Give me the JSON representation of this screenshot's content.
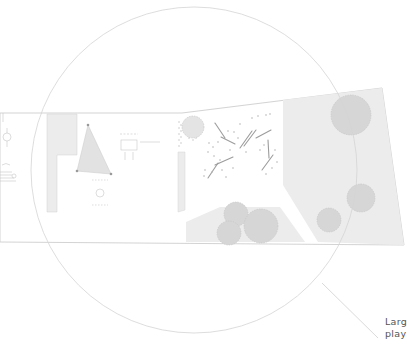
{
  "diagram": {
    "type": "site-plan",
    "colors": {
      "background": "#ffffff",
      "site_outline": "#c8c8c8",
      "paved_fill": "#ececec",
      "tree_fill": "#d6d6d6",
      "tree_edge": "#c4c4c4",
      "focus_circle": "#d4d4d4",
      "leader_line": "#d0d0d0",
      "label_text": "#555555"
    },
    "focus_circle": {
      "cx": 194,
      "cy": 170,
      "r": 163
    },
    "callout": {
      "lines": [
        "Larg",
        "play"
      ],
      "leader": {
        "x1": 322,
        "y1": 283,
        "x2": 378,
        "y2": 338
      }
    },
    "trees": [
      {
        "cx": 351,
        "cy": 115,
        "r": 20
      },
      {
        "cx": 361,
        "cy": 198,
        "r": 14
      },
      {
        "cx": 329,
        "cy": 220,
        "r": 12
      },
      {
        "cx": 236,
        "cy": 214,
        "r": 12
      },
      {
        "cx": 261,
        "cy": 226,
        "r": 17
      },
      {
        "cx": 229,
        "cy": 233,
        "r": 12
      },
      {
        "cx": 193,
        "cy": 127,
        "r": 11
      }
    ]
  }
}
